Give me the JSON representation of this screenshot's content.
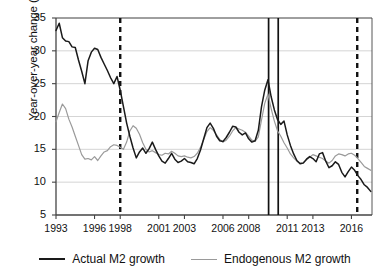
{
  "chart_data": {
    "type": "line",
    "title": "",
    "xlabel": "",
    "ylabel": "Year-over-year change (%)",
    "xlim": [
      1993,
      2017.6
    ],
    "ylim": [
      5,
      35
    ],
    "yticks": [
      5,
      10,
      15,
      20,
      25,
      30,
      35
    ],
    "xticks": [
      1993,
      1996,
      1998,
      2001,
      2003,
      2006,
      2008,
      2011,
      2013,
      2016
    ],
    "grid": "horizontal",
    "legend_position": "bottom-center",
    "colors": {
      "actual": "#1a1a1a",
      "endogenous": "#9a9a9a",
      "marker_line": "#111111"
    },
    "vertical_markers": [
      {
        "x": 1998.0,
        "style": "dashed"
      },
      {
        "x": 2009.55,
        "style": "solid"
      },
      {
        "x": 2010.3,
        "style": "solid"
      },
      {
        "x": 2016.45,
        "style": "dashed"
      }
    ],
    "series": [
      {
        "name": "Actual M2 growth",
        "color": "#1a1a1a",
        "x": [
          1993.0,
          1993.25,
          1993.5,
          1993.75,
          1994.0,
          1994.25,
          1994.5,
          1994.75,
          1995.0,
          1995.25,
          1995.5,
          1995.75,
          1996.0,
          1996.25,
          1996.5,
          1996.75,
          1997.0,
          1997.25,
          1997.5,
          1997.75,
          1998.0,
          1998.25,
          1998.5,
          1998.75,
          1999.0,
          1999.25,
          1999.5,
          1999.75,
          2000.0,
          2000.25,
          2000.5,
          2000.75,
          2001.0,
          2001.25,
          2001.5,
          2001.75,
          2002.0,
          2002.25,
          2002.5,
          2002.75,
          2003.0,
          2003.25,
          2003.5,
          2003.75,
          2004.0,
          2004.25,
          2004.5,
          2004.75,
          2005.0,
          2005.25,
          2005.5,
          2005.75,
          2006.0,
          2006.25,
          2006.5,
          2006.75,
          2007.0,
          2007.25,
          2007.5,
          2007.75,
          2008.0,
          2008.25,
          2008.5,
          2008.75,
          2009.0,
          2009.25,
          2009.5,
          2009.75,
          2010.0,
          2010.25,
          2010.5,
          2010.75,
          2011.0,
          2011.25,
          2011.5,
          2011.75,
          2012.0,
          2012.25,
          2012.5,
          2012.75,
          2013.0,
          2013.25,
          2013.5,
          2013.75,
          2014.0,
          2014.25,
          2014.5,
          2014.75,
          2015.0,
          2015.25,
          2015.5,
          2015.75,
          2016.0,
          2016.25,
          2016.5,
          2016.75,
          2017.0,
          2017.25,
          2017.5
        ],
        "y": [
          33.1,
          34.2,
          32.0,
          31.5,
          31.4,
          30.6,
          30.5,
          28.6,
          26.9,
          25.0,
          28.5,
          29.8,
          30.4,
          30.2,
          29.0,
          28.0,
          27.0,
          25.9,
          25.0,
          26.1,
          24.0,
          21.5,
          19.0,
          17.0,
          15.2,
          13.7,
          14.6,
          15.2,
          14.4,
          15.1,
          16.1,
          15.0,
          14.0,
          13.2,
          12.9,
          13.6,
          14.4,
          13.5,
          13.0,
          13.2,
          13.6,
          13.1,
          13.0,
          12.8,
          13.6,
          14.9,
          16.6,
          18.3,
          19.0,
          18.2,
          17.0,
          16.3,
          16.2,
          16.8,
          17.6,
          18.5,
          18.4,
          17.6,
          17.2,
          17.5,
          16.6,
          16.1,
          16.3,
          17.9,
          21.5,
          24.0,
          25.6,
          23.0,
          21.0,
          19.5,
          18.8,
          19.3,
          17.2,
          15.6,
          14.3,
          13.3,
          12.8,
          12.9,
          13.5,
          13.9,
          13.6,
          13.1,
          14.3,
          14.5,
          13.2,
          12.2,
          12.5,
          13.1,
          12.7,
          11.5,
          10.8,
          11.6,
          12.3,
          11.8,
          11.0,
          10.4,
          9.6,
          9.2,
          8.6
        ]
      },
      {
        "name": "Endogenous M2 growth",
        "color": "#9a9a9a",
        "x": [
          1993.0,
          1993.25,
          1993.5,
          1993.75,
          1994.0,
          1994.25,
          1994.5,
          1994.75,
          1995.0,
          1995.25,
          1995.5,
          1995.75,
          1996.0,
          1996.25,
          1996.5,
          1996.75,
          1997.0,
          1997.25,
          1997.5,
          1997.75,
          1998.0,
          1998.25,
          1998.5,
          1998.75,
          1999.0,
          1999.25,
          1999.5,
          1999.75,
          2000.0,
          2000.25,
          2000.5,
          2000.75,
          2001.0,
          2001.25,
          2001.5,
          2001.75,
          2002.0,
          2002.25,
          2002.5,
          2002.75,
          2003.0,
          2003.25,
          2003.5,
          2003.75,
          2004.0,
          2004.25,
          2004.5,
          2004.75,
          2005.0,
          2005.25,
          2005.5,
          2005.75,
          2006.0,
          2006.25,
          2006.5,
          2006.75,
          2007.0,
          2007.25,
          2007.5,
          2007.75,
          2008.0,
          2008.25,
          2008.5,
          2008.75,
          2009.0,
          2009.25,
          2009.5,
          2009.75,
          2010.0,
          2010.25,
          2010.5,
          2010.75,
          2011.0,
          2011.25,
          2011.5,
          2011.75,
          2012.0,
          2012.25,
          2012.5,
          2012.75,
          2013.0,
          2013.25,
          2013.5,
          2013.75,
          2014.0,
          2014.25,
          2014.5,
          2014.75,
          2015.0,
          2015.25,
          2015.5,
          2015.75,
          2016.0,
          2016.25,
          2016.5,
          2016.75,
          2017.0,
          2017.25,
          2017.5
        ],
        "y": [
          19.2,
          20.6,
          21.9,
          21.2,
          19.6,
          18.4,
          17.0,
          15.6,
          14.2,
          13.5,
          13.6,
          13.4,
          13.9,
          13.3,
          14.0,
          14.6,
          14.8,
          15.4,
          15.7,
          15.6,
          15.3,
          15.0,
          16.1,
          17.8,
          18.6,
          18.2,
          17.3,
          16.0,
          15.0,
          14.6,
          14.8,
          14.5,
          14.2,
          14.1,
          14.4,
          14.3,
          14.7,
          14.4,
          14.0,
          13.9,
          14.0,
          13.8,
          13.7,
          13.9,
          14.4,
          15.3,
          16.5,
          17.7,
          18.3,
          17.9,
          17.2,
          16.5,
          16.1,
          16.4,
          17.0,
          17.8,
          18.3,
          18.1,
          17.9,
          17.6,
          17.0,
          16.4,
          16.2,
          16.9,
          19.5,
          22.0,
          23.4,
          21.2,
          19.3,
          17.8,
          17.0,
          16.0,
          15.2,
          14.3,
          13.7,
          13.2,
          12.9,
          13.0,
          13.4,
          13.8,
          14.2,
          14.0,
          13.8,
          13.6,
          13.2,
          12.9,
          13.3,
          14.0,
          14.3,
          14.2,
          14.0,
          14.3,
          14.4,
          14.1,
          13.6,
          13.0,
          12.4,
          12.1,
          11.8
        ]
      }
    ],
    "legend": [
      {
        "label": "Actual M2 growth",
        "color": "#1a1a1a",
        "style": "solid-thick"
      },
      {
        "label": "Endogenous M2 growth",
        "color": "#9a9a9a",
        "style": "solid-thin"
      }
    ]
  }
}
